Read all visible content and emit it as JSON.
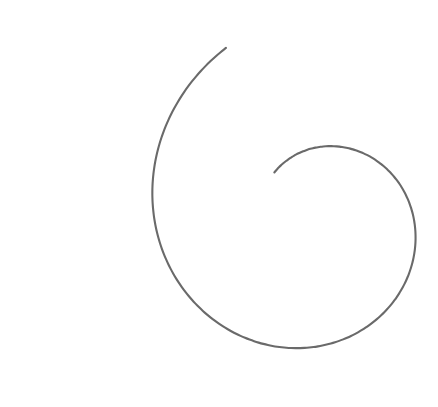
{
  "figure": {
    "title": "Spiral Curve Line Drawing",
    "kind": "vector-line-drawing",
    "width": 438,
    "height": 407,
    "background_color": "#ffffff",
    "stroke_color": "#6a6a6a",
    "stroke_width": 2.1,
    "fill": "none"
  },
  "chart_data": {
    "type": "line",
    "title": "Spiral Curve Line Drawing",
    "xlabel": "",
    "ylabel": "",
    "xlim": [
      0,
      438
    ],
    "ylim": [
      407,
      0
    ],
    "grid": false,
    "legend": "none",
    "series": [
      {
        "name": "spiral",
        "stroke": "#6a6a6a",
        "spiral_model": {
          "form": "logarithmic",
          "center_x": 318,
          "center_y": 221,
          "r0": 196.0,
          "growth_b": -0.1685,
          "theta_start_deg": 118,
          "theta_end_deg": 492,
          "theta_step_deg": 2,
          "rotation_sense": "clockwise-inward",
          "ellipse_x_scale": 1.0,
          "ellipse_y_scale": 1.0
        },
        "anchor_points": [
          {
            "label": "top-edge-entry",
            "x": 308,
            "y": 0
          },
          {
            "label": "upper-left-shoulder",
            "x": 112,
            "y": 46
          },
          {
            "label": "leftmost-extremum",
            "x": 29,
            "y": 172
          },
          {
            "label": "lower-left",
            "x": 78,
            "y": 312
          },
          {
            "label": "bottom-extremum",
            "x": 255,
            "y": 393
          },
          {
            "label": "lower-right",
            "x": 365,
            "y": 341
          },
          {
            "label": "rightmost-extremum",
            "x": 400,
            "y": 255
          },
          {
            "label": "coil-outer-right",
            "x": 374,
            "y": 186
          },
          {
            "label": "coil-top",
            "x": 310,
            "y": 160
          },
          {
            "label": "coil-left",
            "x": 268,
            "y": 215
          },
          {
            "label": "coil-bottom",
            "x": 315,
            "y": 278
          },
          {
            "label": "hook-right",
            "x": 349,
            "y": 250
          },
          {
            "label": "hook-terminus",
            "x": 337,
            "y": 228
          }
        ]
      }
    ]
  }
}
